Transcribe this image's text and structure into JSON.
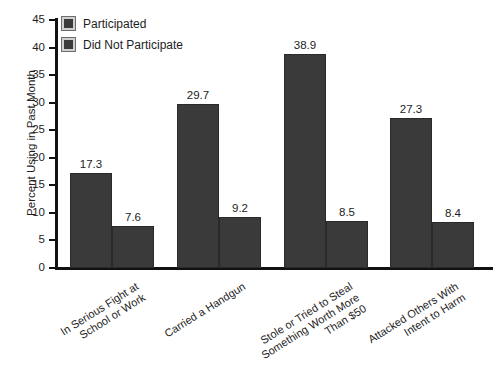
{
  "chart_data": {
    "type": "bar",
    "title": "",
    "xlabel": "",
    "ylabel": "Percent Using in Past Month",
    "ylim": [
      0,
      45
    ],
    "yticks": [
      0,
      5,
      10,
      15,
      20,
      25,
      30,
      35,
      40,
      45
    ],
    "grid": false,
    "legend_position": "top-left",
    "categories": [
      "In Serious Fight at\nSchool or Work",
      "Carried a Handgun",
      "Stole or Tried to Steal\nSomething Worth More\nThan $50",
      "Attacked Others With\nIntent to Harm"
    ],
    "series": [
      {
        "name": "Participated",
        "values": [
          17.3,
          29.7,
          38.9,
          27.3
        ],
        "color": "#3a3a3a"
      },
      {
        "name": "Did Not Participate",
        "values": [
          7.6,
          9.2,
          8.5,
          8.4
        ],
        "color": "#3a3a3a"
      }
    ]
  },
  "legend": {
    "items": [
      {
        "label": "Participated"
      },
      {
        "label": "Did Not Participate"
      }
    ]
  },
  "axis": {
    "y_title": "Percent Using in Past Month",
    "y_tick_labels": [
      "45",
      "40",
      "35",
      "30",
      "25",
      "20",
      "15",
      "10",
      "5",
      "0"
    ]
  },
  "bar_labels": [
    "17.3",
    "7.6",
    "29.7",
    "9.2",
    "38.9",
    "8.5",
    "27.3",
    "8.4"
  ],
  "category_labels": [
    {
      "line1": "In Serious Fight at",
      "line2": "School or Work",
      "line3": ""
    },
    {
      "line1": "Carried a Handgun",
      "line2": "",
      "line3": ""
    },
    {
      "line1": "Stole or Tried to Steal",
      "line2": "Something Worth More",
      "line3": "Than $50"
    },
    {
      "line1": "Attacked Others With",
      "line2": "Intent to Harm",
      "line3": ""
    }
  ]
}
